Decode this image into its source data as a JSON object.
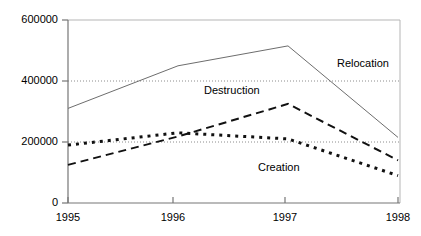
{
  "chart_data": {
    "type": "line",
    "title": "",
    "subtitle": "",
    "xlabel": "",
    "ylabel": "",
    "categories": [
      "1995",
      "1996",
      "1997",
      "1998"
    ],
    "x": [
      1995,
      1996,
      1997,
      1998
    ],
    "xlim": [
      1995,
      1998
    ],
    "ylim": [
      0,
      600000
    ],
    "y_ticks": [
      0,
      200000,
      400000,
      600000
    ],
    "y_tick_labels": [
      "0",
      "200000",
      "400000",
      "600000"
    ],
    "x_ticks": [
      1995,
      1996,
      1997,
      1998
    ],
    "x_tick_labels": [
      "1995",
      "1996",
      "1997",
      "1998"
    ],
    "grid": "horizontal-dotted",
    "gridlines_at": [
      200000,
      400000
    ],
    "legend": "inline-annotations",
    "series": [
      {
        "name": "Relocation",
        "style": "solid",
        "color": "#555555",
        "values": [
          310000,
          450000,
          515000,
          215000
        ],
        "label_x": 1997.45,
        "label_y": 455000
      },
      {
        "name": "Destruction",
        "style": "dashed",
        "color": "#000000",
        "values": [
          125000,
          218000,
          325000,
          140000
        ],
        "label_x": 1996.35,
        "label_y": 365000
      },
      {
        "name": "Creation",
        "style": "dotted",
        "color": "#000000",
        "values": [
          190000,
          230000,
          210000,
          90000
        ],
        "label_x": 1996.85,
        "label_y": 115000
      }
    ],
    "annotations": [
      {
        "text": "Relocation",
        "series": "Relocation"
      },
      {
        "text": "Destruction",
        "series": "Destruction"
      },
      {
        "text": "Creation",
        "series": "Creation"
      }
    ]
  },
  "colors": {
    "background": "#ffffff",
    "axis": "#808080",
    "plot_border": "#aaaaaa",
    "gridline": "#999999",
    "text": "#000000"
  }
}
